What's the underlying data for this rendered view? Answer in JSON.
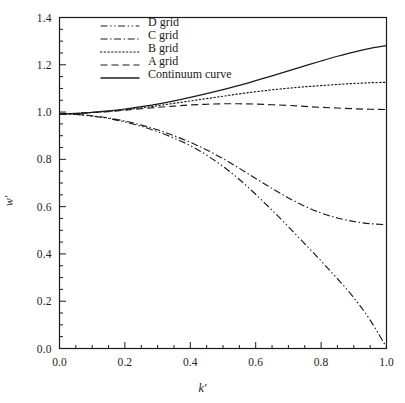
{
  "figure": {
    "background_color": "#ffffff",
    "foreground_color": "#1a1a1a",
    "top_caption": ""
  },
  "chart_data": {
    "type": "line",
    "title": "",
    "xlabel": "k'",
    "ylabel": "w'",
    "xlim": [
      0.0,
      1.0
    ],
    "ylim": [
      0.0,
      1.4
    ],
    "grid": false,
    "legend_position": "top-left-inside",
    "x_major_ticks": [
      0.0,
      0.2,
      0.4,
      0.6,
      0.8,
      1.0
    ],
    "x_major_tick_labels": [
      "0.0",
      "0.2",
      "0.4",
      "0.6",
      "0.8",
      "1.0"
    ],
    "x_minor_tick_interval": 0.05,
    "y_major_ticks": [
      0.0,
      0.2,
      0.4,
      0.6,
      0.8,
      1.0,
      1.2,
      1.4
    ],
    "y_major_tick_labels": [
      "0.0",
      "0.2",
      "0.4",
      "0.6",
      "0.8",
      "1.0",
      "1.2",
      "1.4"
    ],
    "y_minor_tick_interval": 0.05,
    "x": [
      0.0,
      0.05,
      0.1,
      0.15,
      0.2,
      0.25,
      0.3,
      0.35,
      0.4,
      0.45,
      0.5,
      0.55,
      0.6,
      0.65,
      0.7,
      0.75,
      0.8,
      0.85,
      0.9,
      0.95,
      1.0
    ],
    "series": [
      {
        "name": "D grid",
        "dash_style": "dash-dot-dot",
        "color": "#1a1a1a",
        "values": [
          0.992,
          0.99,
          0.983,
          0.973,
          0.958,
          0.94,
          0.917,
          0.89,
          0.858,
          0.818,
          0.77,
          0.715,
          0.652,
          0.585,
          0.515,
          0.443,
          0.37,
          0.295,
          0.215,
          0.12,
          0.005
        ]
      },
      {
        "name": "C grid",
        "dash_style": "dash-dot",
        "color": "#1a1a1a",
        "values": [
          0.992,
          0.99,
          0.984,
          0.975,
          0.962,
          0.945,
          0.925,
          0.9,
          0.872,
          0.84,
          0.803,
          0.762,
          0.719,
          0.677,
          0.637,
          0.602,
          0.573,
          0.552,
          0.537,
          0.528,
          0.524
        ]
      },
      {
        "name": "B grid",
        "dash_style": "dotted",
        "color": "#1a1a1a",
        "values": [
          0.992,
          0.994,
          0.998,
          1.003,
          1.01,
          1.018,
          1.027,
          1.037,
          1.047,
          1.057,
          1.067,
          1.077,
          1.086,
          1.094,
          1.101,
          1.107,
          1.112,
          1.117,
          1.121,
          1.124,
          1.126
        ]
      },
      {
        "name": "A grid",
        "dash_style": "dashed",
        "color": "#1a1a1a",
        "values": [
          0.992,
          0.994,
          0.998,
          1.002,
          1.008,
          1.014,
          1.02,
          1.025,
          1.03,
          1.033,
          1.035,
          1.035,
          1.034,
          1.031,
          1.028,
          1.024,
          1.02,
          1.017,
          1.014,
          1.012,
          1.011
        ]
      },
      {
        "name": "Continuum curve",
        "dash_style": "solid",
        "color": "#1a1a1a",
        "values": [
          0.992,
          0.994,
          0.999,
          1.005,
          1.013,
          1.023,
          1.034,
          1.047,
          1.062,
          1.078,
          1.095,
          1.113,
          1.133,
          1.153,
          1.174,
          1.195,
          1.216,
          1.236,
          1.254,
          1.269,
          1.281
        ]
      }
    ],
    "legend_entries": [
      {
        "label": "D grid",
        "dash_style": "dash-dot-dot"
      },
      {
        "label": "C grid",
        "dash_style": "dash-dot"
      },
      {
        "label": "B grid",
        "dash_style": "dotted"
      },
      {
        "label": "A grid",
        "dash_style": "dashed"
      },
      {
        "label": "Continuum curve",
        "dash_style": "solid"
      }
    ]
  }
}
